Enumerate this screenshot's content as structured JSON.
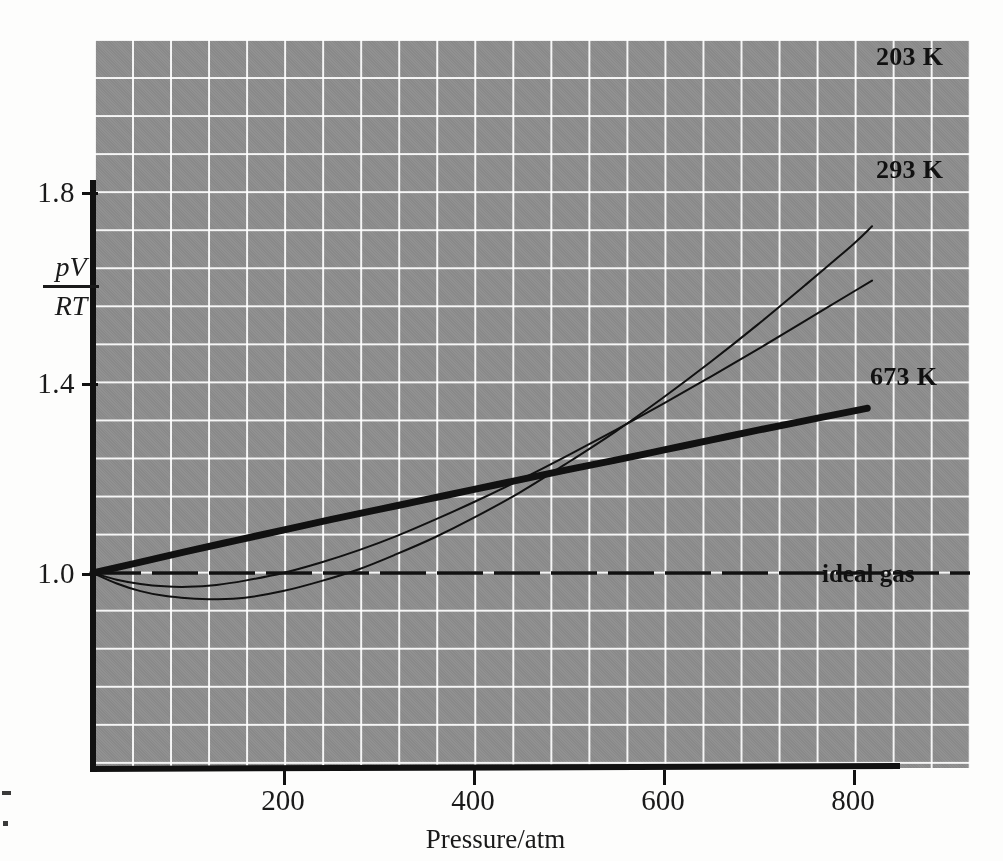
{
  "figure": {
    "background_color": "#fdfdfc",
    "panel_color": "#8d8d8d",
    "grid_color": "#ffffff",
    "ink_color": "#111111"
  },
  "axes": {
    "x": {
      "label": "Pressure/atm",
      "ticks": [
        200,
        400,
        600,
        800
      ],
      "tick_labels": [
        "200",
        "400",
        "600",
        "800"
      ],
      "range": [
        0,
        920
      ]
    },
    "y": {
      "label_numerator": "pV",
      "label_denominator": "RT",
      "ticks": [
        1.0,
        1.4,
        1.8
      ],
      "tick_labels": [
        "1.0",
        "1.4",
        "1.8"
      ],
      "range": [
        0.59,
        2.13
      ]
    }
  },
  "series_labels": {
    "t203": "203 K",
    "t293": "293 K",
    "t673": "673 K",
    "ideal": "ideal gas"
  },
  "chart_data": {
    "type": "line",
    "title": "",
    "xlabel": "Pressure/atm",
    "ylabel": "pV/RT",
    "xlim": [
      0,
      920
    ],
    "ylim": [
      0.59,
      2.13
    ],
    "grid": true,
    "legend": "inline-end-labels",
    "x_ticks": [
      200,
      400,
      600,
      800
    ],
    "y_ticks": [
      1.0,
      1.4,
      1.8
    ],
    "series": [
      {
        "name": "203 K",
        "color": "#111111",
        "line_width": 2,
        "style": "solid",
        "x": [
          0,
          25,
          50,
          75,
          100,
          130,
          160,
          200,
          240,
          280,
          320,
          360,
          400,
          450,
          500,
          550,
          600,
          650,
          700,
          750,
          800,
          820
        ],
        "values": [
          1.0,
          0.978,
          0.962,
          0.952,
          0.947,
          0.945,
          0.948,
          0.962,
          0.983,
          1.008,
          1.04,
          1.075,
          1.115,
          1.17,
          1.232,
          1.297,
          1.368,
          1.443,
          1.522,
          1.605,
          1.69,
          1.728
        ]
      },
      {
        "name": "293 K",
        "color": "#111111",
        "line_width": 2,
        "style": "solid",
        "x": [
          0,
          25,
          50,
          75,
          100,
          130,
          160,
          200,
          240,
          280,
          320,
          360,
          400,
          450,
          500,
          550,
          600,
          650,
          700,
          750,
          800,
          820
        ],
        "values": [
          1.0,
          0.986,
          0.977,
          0.972,
          0.971,
          0.975,
          0.984,
          1.0,
          1.022,
          1.048,
          1.078,
          1.112,
          1.148,
          1.196,
          1.247,
          1.3,
          1.355,
          1.412,
          1.47,
          1.53,
          1.59,
          1.614
        ]
      },
      {
        "name": "673 K",
        "color": "#111111",
        "line_width": 7,
        "style": "solid",
        "x": [
          0,
          50,
          100,
          150,
          200,
          250,
          300,
          350,
          400,
          450,
          500,
          550,
          600,
          650,
          700,
          750,
          800,
          815
        ],
        "values": [
          1.0,
          1.023,
          1.046,
          1.068,
          1.09,
          1.112,
          1.133,
          1.154,
          1.175,
          1.196,
          1.217,
          1.237,
          1.258,
          1.279,
          1.3,
          1.32,
          1.34,
          1.346
        ]
      },
      {
        "name": "ideal gas",
        "color": "#111111",
        "line_width": 3,
        "style": "dashed",
        "x": [
          0,
          920
        ],
        "values": [
          1.0,
          1.0
        ]
      }
    ]
  }
}
